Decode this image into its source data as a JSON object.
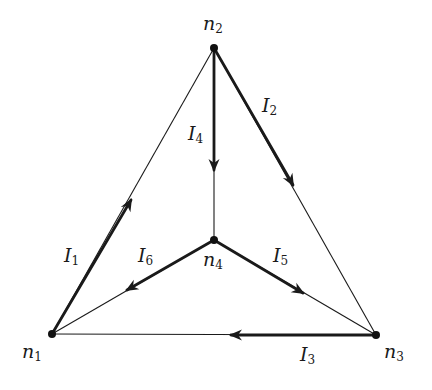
{
  "diagram": {
    "type": "directed-graph",
    "colors": {
      "line": "#1a1a1a",
      "node": "#111111",
      "background": "#ffffff"
    },
    "nodes": [
      {
        "id": "n1",
        "name": "n",
        "sub": "1",
        "x": 52,
        "y": 334,
        "label_x": 22,
        "label_y": 344
      },
      {
        "id": "n2",
        "name": "n",
        "sub": "2",
        "x": 214,
        "y": 48,
        "label_x": 203,
        "label_y": 14
      },
      {
        "id": "n3",
        "name": "n",
        "sub": "3",
        "x": 376,
        "y": 335,
        "label_x": 385,
        "label_y": 344
      },
      {
        "id": "n4",
        "name": "n",
        "sub": "4",
        "x": 214,
        "y": 240,
        "label_x": 203,
        "label_y": 252
      }
    ],
    "edges": [
      {
        "id": "I1",
        "name": "I",
        "sub": "1",
        "from": "n1",
        "to": "n2",
        "arrow_x": 131,
        "arrow_y": 200,
        "label_x": 64,
        "label_y": 248
      },
      {
        "id": "I2",
        "name": "I",
        "sub": "2",
        "from": "n2",
        "to": "n3",
        "arrow_x": 293,
        "arrow_y": 185,
        "label_x": 262,
        "label_y": 98
      },
      {
        "id": "I3",
        "name": "I",
        "sub": "3",
        "from": "n3",
        "to": "n1",
        "arrow_x": 231,
        "arrow_y": 335,
        "label_x": 300,
        "label_y": 346
      },
      {
        "id": "I4",
        "name": "I",
        "sub": "4",
        "from": "n2",
        "to": "n4",
        "arrow_x": 214,
        "arrow_y": 170,
        "label_x": 188,
        "label_y": 124
      },
      {
        "id": "I5",
        "name": "I",
        "sub": "5",
        "from": "n4",
        "to": "n3",
        "arrow_x": 303,
        "arrow_y": 293,
        "label_x": 273,
        "label_y": 248
      },
      {
        "id": "I6",
        "name": "I",
        "sub": "6",
        "from": "n4",
        "to": "n1",
        "arrow_x": 127,
        "arrow_y": 290,
        "label_x": 138,
        "label_y": 248
      }
    ]
  },
  "labels": {
    "n1": "n",
    "n1_sub": "1",
    "n2": "n",
    "n2_sub": "2",
    "n3": "n",
    "n3_sub": "3",
    "n4": "n",
    "n4_sub": "4",
    "I1": "I",
    "I1_sub": "1",
    "I2": "I",
    "I2_sub": "2",
    "I3": "I",
    "I3_sub": "3",
    "I4": "I",
    "I4_sub": "4",
    "I5": "I",
    "I5_sub": "5",
    "I6": "I",
    "I6_sub": "6"
  }
}
